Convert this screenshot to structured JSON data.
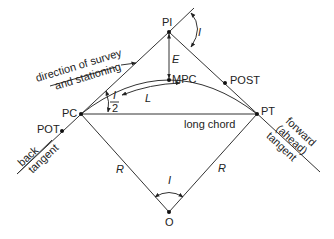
{
  "diagram": {
    "colors": {
      "line": "#333333",
      "text": "#222222",
      "background": "#ffffff"
    },
    "points": {
      "PI": "PI",
      "PC": "PC",
      "PT": "PT",
      "O": "O",
      "MPC": "MPC",
      "POT": "POT",
      "POST": "POST"
    },
    "symbols": {
      "E": "E",
      "L": "L",
      "R_left": "R",
      "R_right": "R",
      "I_top": "I",
      "I_center": "I",
      "half_I_num": "I",
      "half_I_den": "2"
    },
    "labels": {
      "direction_line1": "direction of survey",
      "direction_line2": "and stationing",
      "long_chord": "long chord",
      "back_line1": "back",
      "back_line2": "tangent",
      "forward_line1": "forward",
      "forward_line2": "(ahead)",
      "forward_line3": "tangent"
    }
  }
}
